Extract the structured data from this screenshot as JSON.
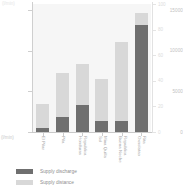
{
  "chart_data": {
    "type": "bar",
    "stacked": true,
    "title": "",
    "subtitle": "",
    "xlabel": "",
    "ylabel": "(l/min)",
    "y_axis_title": "(l/min)",
    "ylim": [
      0,
      15800
    ],
    "yticks": [
      0,
      5000,
      10000,
      15000
    ],
    "ytick_labels": [
      "0",
      "5000",
      "10000",
      "15000"
    ],
    "secondary_axis": {
      "visible": true,
      "ticks": [
        0,
        20,
        40,
        60,
        80,
        100
      ],
      "tick_labels": [
        "0",
        "20",
        "40",
        "60",
        "80",
        "100"
      ]
    },
    "grid": false,
    "legend_position": "bottom-left",
    "categories": [
      "El Pilar",
      "Pila",
      "Republica Honduras",
      "Mina Quilla Sol",
      "Republica Buena Noche",
      "Rita Oxnolatao"
    ],
    "category_lines": [
      [
        "El Pilar"
      ],
      [
        "Pila"
      ],
      [
        "Republica",
        "Honduras"
      ],
      [
        "Mina Quilla",
        "Sol"
      ],
      [
        "Republica",
        "Buena Noche"
      ],
      [
        "Rita",
        "Oxnolatao"
      ]
    ],
    "series": [
      {
        "name": "Supply discharge",
        "color": "#6f6f6f",
        "values": [
          450,
          1900,
          3300,
          1350,
          1400,
          13200
        ]
      },
      {
        "name": "Supply distance",
        "color": "#d8d8d8",
        "values": [
          3000,
          5400,
          5100,
          5200,
          9700,
          1500
        ]
      }
    ],
    "totals": [
      3450,
      7300,
      8400,
      6550,
      11100,
      14700
    ]
  },
  "legend": {
    "items": [
      {
        "label": "Supply discharge",
        "color": "#6f6f6f"
      },
      {
        "label": "Supply distance",
        "color": "#d8d8d8"
      }
    ]
  },
  "colors": {
    "plot_background": "#f6f6f6",
    "axis": "#cfcfcf",
    "tick_text": "#c2c2c2",
    "label_text": "#a8a8a8",
    "legend_text": "#8e8e8e"
  }
}
